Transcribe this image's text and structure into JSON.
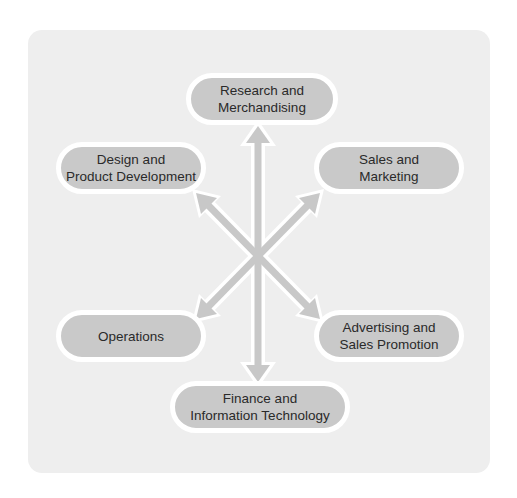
{
  "diagram": {
    "colors": {
      "background": "#ffffff",
      "panel": "#eeeeee",
      "node_fill": "#c9c9c9",
      "node_border": "#ffffff",
      "arrow": "#c8c8c8",
      "text": "#2a2a2a"
    },
    "nodes": {
      "top": {
        "line1": "Research and",
        "line2": "Merchandising"
      },
      "top_left": {
        "line1": "Design and",
        "line2": "Product Development"
      },
      "top_right": {
        "line1": "Sales and",
        "line2": "Marketing"
      },
      "bottom_left": {
        "line1": "Operations"
      },
      "bottom_right": {
        "line1": "Advertising and",
        "line2": "Sales Promotion"
      },
      "bottom": {
        "line1": "Finance and",
        "line2": "Information Technology"
      }
    },
    "connections": [
      {
        "from": "center",
        "to": "top",
        "type": "double-arrow"
      },
      {
        "from": "center",
        "to": "bottom",
        "type": "double-arrow"
      },
      {
        "from": "center",
        "to": "top_left",
        "type": "double-arrow"
      },
      {
        "from": "center",
        "to": "top_right",
        "type": "double-arrow"
      },
      {
        "from": "center",
        "to": "bottom_left",
        "type": "double-arrow"
      },
      {
        "from": "center",
        "to": "bottom_right",
        "type": "double-arrow"
      }
    ]
  }
}
